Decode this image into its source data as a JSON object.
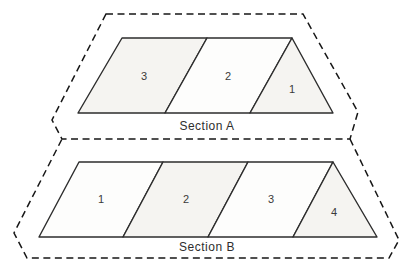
{
  "sections": [
    {
      "name": "Section A",
      "regions": [
        "3",
        "2",
        "1"
      ]
    },
    {
      "name": "Section B",
      "regions": [
        "1",
        "2",
        "3",
        "4"
      ]
    }
  ],
  "colors": {
    "solid_line": "#2d2d2d",
    "dashed_outline": "#161616",
    "region_fill_shaded": "#f5f4f1",
    "region_fill_plain": "#fdfdfc",
    "background": "#ffffff"
  }
}
